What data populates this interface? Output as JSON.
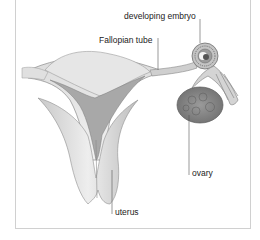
{
  "diagram": {
    "labels": {
      "embryo": "developing embryo",
      "fallopian_tube": "Fallopian tube",
      "ovary": "ovary",
      "uterus": "uterus"
    },
    "colors": {
      "background": "#ffffff",
      "frame": "#d0d0d0",
      "label_text": "#222222",
      "leader_line": "#555555",
      "tissue_light": "#e4e4e4",
      "tissue_mid": "#b8b8b8",
      "tissue_dark": "#7a7a7a"
    }
  }
}
